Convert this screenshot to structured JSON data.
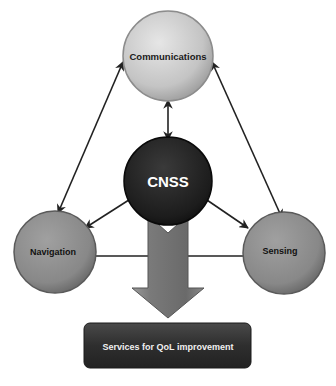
{
  "diagram": {
    "nodes": {
      "communications": {
        "label": "Communications",
        "fill": "#c8c8c8",
        "text_color": "#1a1a1a"
      },
      "cnss": {
        "label": "CNSS",
        "fill": "#1e1e1e",
        "text_color": "#ffffff"
      },
      "navigation": {
        "label": "Navigation",
        "fill": "#8a8a8a",
        "text_color": "#111111"
      },
      "sensing": {
        "label": "Sensing",
        "fill": "#8a8a8a",
        "text_color": "#111111"
      },
      "services": {
        "label": "Services for QoL improvement",
        "fill": "#333333",
        "text_color": "#f0f0f0"
      }
    },
    "edges": [
      {
        "from": "communications",
        "to": "cnss",
        "type": "bidirectional"
      },
      {
        "from": "communications",
        "to": "navigation",
        "type": "bidirectional"
      },
      {
        "from": "communications",
        "to": "sensing",
        "type": "bidirectional"
      },
      {
        "from": "navigation",
        "to": "sensing",
        "type": "bidirectional"
      },
      {
        "from": "cnss",
        "to": "navigation",
        "type": "directed"
      },
      {
        "from": "cnss",
        "to": "sensing",
        "type": "directed"
      },
      {
        "from": "cnss",
        "to": "services",
        "type": "block-arrow"
      }
    ]
  }
}
